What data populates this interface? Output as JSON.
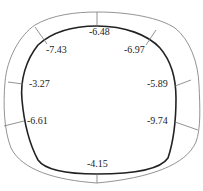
{
  "diagram": {
    "type": "tunnel-lining-cross-section",
    "outer_color": "#777777",
    "inner_color": "#222222",
    "labels": [
      {
        "id": "top",
        "text": "-6.48",
        "x": 89,
        "y": 27
      },
      {
        "id": "upper-left",
        "text": "-7.43",
        "x": 47,
        "y": 45
      },
      {
        "id": "upper-right",
        "text": "-6.97",
        "x": 125,
        "y": 45
      },
      {
        "id": "left-upper",
        "text": "-3.27",
        "x": 30,
        "y": 79
      },
      {
        "id": "right-upper",
        "text": "-5.89",
        "x": 148,
        "y": 79
      },
      {
        "id": "left-lower",
        "text": "-6.61",
        "x": 28,
        "y": 116
      },
      {
        "id": "right-lower",
        "text": "-9.74",
        "x": 146,
        "y": 116
      },
      {
        "id": "bottom",
        "text": "-4.15",
        "x": 87,
        "y": 158
      }
    ]
  }
}
